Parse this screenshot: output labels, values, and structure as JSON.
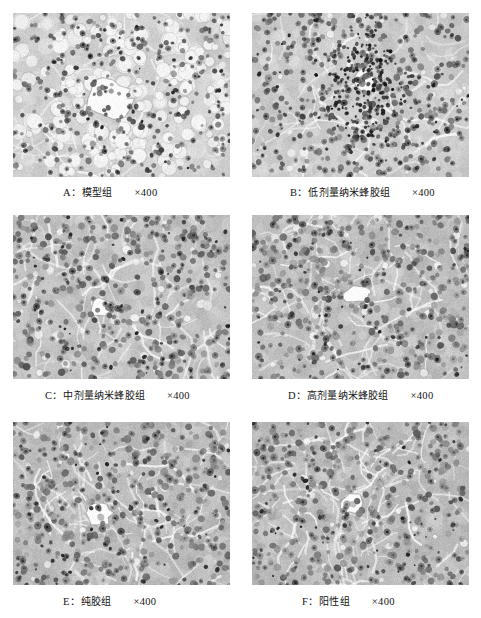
{
  "figure": {
    "type": "histology-micrograph-grid",
    "background_color": "#ffffff",
    "columns": 2,
    "rows": 3,
    "magnification_all": "×400",
    "stain_appearance": "grayscale H&E",
    "panels": [
      {
        "id": "A",
        "label": "A：",
        "group_name": "模型组",
        "magnification": "×400",
        "caption_full": "A：模型组　×400",
        "description": "central vein with extensive fatty vacuolation",
        "x": 13,
        "y": 13,
        "w": 217,
        "h": 164,
        "caption_x": 63,
        "caption_y": 184,
        "texture": {
          "seed": 11,
          "base_gray": 212,
          "contrast": 0.42,
          "cell_count": 330,
          "cell_radius": [
            4.0,
            8.5
          ],
          "nucleus_count": 300,
          "nucleus_radius": [
            1.6,
            3.2
          ],
          "nucleus_darkness": 0.62,
          "vacuole_count": 190,
          "vacuole_radius": [
            3.0,
            8.0
          ],
          "vacuole_brightness": 0.97,
          "vessel": {
            "cx": 0.44,
            "cy": 0.52,
            "rx": 0.105,
            "ry": 0.125,
            "brightness": 1.0
          },
          "sinusoid_count": 40,
          "noise": 0.13
        }
      },
      {
        "id": "B",
        "label": "B：",
        "group_name": "低剂量纳米蜂胶组",
        "magnification": "×400",
        "caption_full": "B：低剂量纳米蜂胶组　×400",
        "description": "portal tract with inflammatory cell infiltration",
        "x": 252,
        "y": 13,
        "w": 217,
        "h": 164,
        "caption_x": 290,
        "caption_y": 184,
        "texture": {
          "seed": 27,
          "base_gray": 205,
          "contrast": 0.4,
          "cell_count": 420,
          "cell_radius": [
            4.0,
            7.5
          ],
          "nucleus_count": 380,
          "nucleus_radius": [
            1.8,
            3.4
          ],
          "nucleus_darkness": 0.6,
          "vacuole_count": 26,
          "vacuole_radius": [
            2.0,
            4.5
          ],
          "vacuole_brightness": 0.95,
          "vessel": {
            "cx": 0.52,
            "cy": 0.42,
            "rx": 0.05,
            "ry": 0.07,
            "brightness": 0.99
          },
          "infiltrate": {
            "cx": 0.52,
            "cy": 0.46,
            "r": 0.2,
            "count": 240,
            "darkness": 0.86
          },
          "sinusoid_count": 46,
          "noise": 0.12
        }
      },
      {
        "id": "C",
        "label": "C：",
        "group_name": "中剂量纳米蜂胶组",
        "magnification": "×400",
        "caption_full": "C：中剂量纳米蜂胶组　×400",
        "description": "central vein, mild hepatocyte change",
        "x": 13,
        "y": 215,
        "w": 217,
        "h": 164,
        "caption_x": 45,
        "caption_y": 387,
        "texture": {
          "seed": 43,
          "base_gray": 197,
          "contrast": 0.44,
          "cell_count": 430,
          "cell_radius": [
            4.5,
            8.0
          ],
          "nucleus_count": 400,
          "nucleus_radius": [
            2.0,
            3.6
          ],
          "nucleus_darkness": 0.56,
          "vacuole_count": 34,
          "vacuole_radius": [
            2.0,
            5.0
          ],
          "vacuole_brightness": 0.95,
          "vessel": {
            "cx": 0.41,
            "cy": 0.56,
            "rx": 0.055,
            "ry": 0.055,
            "brightness": 1.0
          },
          "sinusoid_count": 58,
          "noise": 0.13
        }
      },
      {
        "id": "D",
        "label": "D：",
        "group_name": "高剂量纳米蜂胶组",
        "magnification": "×400",
        "caption_full": "D：高剂量纳米蜂胶组　×400",
        "description": "central vein, near-normal hepatic cords",
        "x": 252,
        "y": 215,
        "w": 217,
        "h": 164,
        "caption_x": 288,
        "caption_y": 387,
        "texture": {
          "seed": 61,
          "base_gray": 193,
          "contrast": 0.46,
          "cell_count": 440,
          "cell_radius": [
            4.5,
            8.0
          ],
          "nucleus_count": 420,
          "nucleus_radius": [
            2.0,
            3.8
          ],
          "nucleus_darkness": 0.52,
          "vacuole_count": 28,
          "vacuole_radius": [
            2.0,
            4.5
          ],
          "vacuole_brightness": 0.95,
          "vessel": {
            "cx": 0.48,
            "cy": 0.48,
            "rx": 0.06,
            "ry": 0.05,
            "brightness": 1.0
          },
          "sinusoid_count": 62,
          "noise": 0.14
        }
      },
      {
        "id": "E",
        "label": "E：",
        "group_name": "纯胶组",
        "magnification": "×400",
        "caption_full": "E：纯胶组　×400",
        "description": "central vein, normal hepatic architecture",
        "x": 13,
        "y": 422,
        "w": 217,
        "h": 163,
        "caption_x": 63,
        "caption_y": 593,
        "texture": {
          "seed": 79,
          "base_gray": 191,
          "contrast": 0.47,
          "cell_count": 450,
          "cell_radius": [
            4.5,
            8.0
          ],
          "nucleus_count": 430,
          "nucleus_radius": [
            2.0,
            3.8
          ],
          "nucleus_darkness": 0.5,
          "vacuole_count": 24,
          "vacuole_radius": [
            2.0,
            4.0
          ],
          "vacuole_brightness": 0.96,
          "vessel": {
            "cx": 0.4,
            "cy": 0.56,
            "rx": 0.055,
            "ry": 0.075,
            "brightness": 1.0
          },
          "sinusoid_count": 66,
          "noise": 0.14
        }
      },
      {
        "id": "F",
        "label": "F：",
        "group_name": "阳性组",
        "magnification": "×400",
        "caption_full": "F：阳性组　×400",
        "description": "central vein, normal hepatic architecture",
        "x": 252,
        "y": 422,
        "w": 217,
        "h": 163,
        "caption_x": 302,
        "caption_y": 593,
        "texture": {
          "seed": 97,
          "base_gray": 190,
          "contrast": 0.48,
          "cell_count": 460,
          "cell_radius": [
            4.5,
            8.0
          ],
          "nucleus_count": 440,
          "nucleus_radius": [
            2.0,
            3.8
          ],
          "nucleus_darkness": 0.48,
          "vacuole_count": 22,
          "vacuole_radius": [
            2.0,
            4.0
          ],
          "vacuole_brightness": 0.96,
          "vessel": {
            "cx": 0.46,
            "cy": 0.5,
            "rx": 0.05,
            "ry": 0.06,
            "brightness": 1.0
          },
          "sinusoid_count": 70,
          "noise": 0.14
        }
      }
    ]
  }
}
